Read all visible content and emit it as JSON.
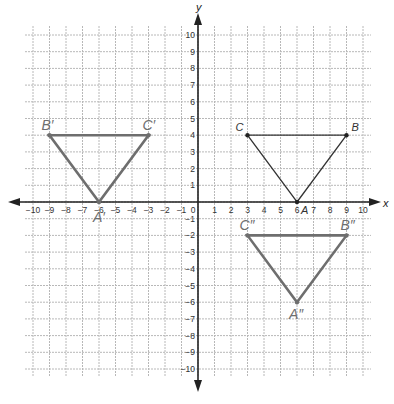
{
  "diagram": {
    "type": "coordinate-plane",
    "x_axis_label": "x",
    "y_axis_label": "y",
    "x_range": [
      -10,
      10
    ],
    "y_range": [
      -10,
      10
    ],
    "x_ticks": [
      -10,
      -9,
      -8,
      -7,
      -6,
      -5,
      -4,
      -3,
      -2,
      -1,
      0,
      1,
      2,
      3,
      4,
      5,
      6,
      7,
      8,
      9,
      10
    ],
    "y_ticks": [
      10,
      9,
      8,
      7,
      6,
      5,
      4,
      3,
      2,
      1,
      -1,
      -2,
      -3,
      -4,
      -5,
      -6,
      -7,
      -8,
      -9,
      -10
    ],
    "colors": {
      "original": "#333333",
      "image": "#6e6e6e",
      "grid": "#b8b8b8",
      "axis": "#222222"
    },
    "triangles": [
      {
        "name": "ABC",
        "role": "original",
        "vertices": [
          {
            "label": "A",
            "x": 6,
            "y": 0,
            "label_dx": 4,
            "label_dy": 12
          },
          {
            "label": "B",
            "x": 9,
            "y": 4,
            "label_dx": 5,
            "label_dy": -4
          },
          {
            "label": "C",
            "x": 3,
            "y": 4,
            "label_dx": -12,
            "label_dy": -4
          }
        ]
      },
      {
        "name": "A'B'C'",
        "role": "image",
        "vertices": [
          {
            "label": "A′",
            "x": -6,
            "y": 0,
            "label_dx": -6,
            "label_dy": 20
          },
          {
            "label": "B′",
            "x": -9,
            "y": 4,
            "label_dx": -8,
            "label_dy": -5
          },
          {
            "label": "C′",
            "x": -3,
            "y": 4,
            "label_dx": -6,
            "label_dy": -5
          }
        ]
      },
      {
        "name": "A''B''C''",
        "role": "image",
        "vertices": [
          {
            "label": "A″",
            "x": 6,
            "y": -6,
            "label_dx": -8,
            "label_dy": 17
          },
          {
            "label": "B″",
            "x": 9,
            "y": -2,
            "label_dx": -6,
            "label_dy": -5
          },
          {
            "label": "C″",
            "x": 3,
            "y": -2,
            "label_dx": -8,
            "label_dy": -5
          }
        ]
      }
    ]
  }
}
